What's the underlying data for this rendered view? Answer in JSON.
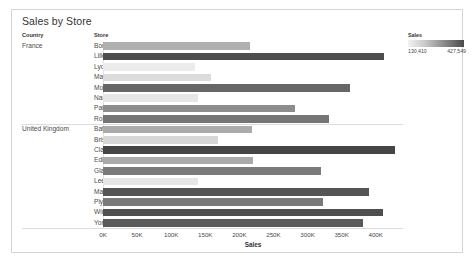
{
  "title": "Sales by Store",
  "columns": {
    "country": "Country",
    "store": "Store"
  },
  "legend": {
    "title": "Sales",
    "min_label": "130,410",
    "max_label": "427,549",
    "min_value": 130410,
    "max_value": 427549,
    "ramp_low_color": "#f2f2f2",
    "ramp_high_color": "#4a4a4a"
  },
  "axis": {
    "title": "Sales",
    "ticks": [
      "0K",
      "50K",
      "100K",
      "150K",
      "200K",
      "250K",
      "300K",
      "350K",
      "400K"
    ],
    "tick_values": [
      0,
      50000,
      100000,
      150000,
      200000,
      250000,
      300000,
      350000,
      400000
    ]
  },
  "chart_data": {
    "type": "bar",
    "title": "Sales by Store",
    "xlabel": "Sales",
    "ylabel": "Store",
    "orientation": "horizontal",
    "xlim": [
      0,
      440000
    ],
    "grid": false,
    "legend_position": "top-right",
    "color_encoding": "Sales",
    "groups": [
      {
        "country": "France",
        "rows": [
          {
            "store": "Bordeaux",
            "value": 215000,
            "color": "#b0b0b0"
          },
          {
            "store": "Lille",
            "value": 412000,
            "color": "#4e4e4e"
          },
          {
            "store": "Lyon",
            "value": 135000,
            "color": "#ececec"
          },
          {
            "store": "Marseille",
            "value": 158000,
            "color": "#dcdcdc"
          },
          {
            "store": "Montpellier",
            "value": 362000,
            "color": "#666666"
          },
          {
            "store": "Nantes",
            "value": 140000,
            "color": "#e6e6e6"
          },
          {
            "store": "Paris",
            "value": 282000,
            "color": "#8d8d8d"
          },
          {
            "store": "Rouen",
            "value": 332000,
            "color": "#757575"
          }
        ]
      },
      {
        "country": "United Kingdom",
        "rows": [
          {
            "store": "Bath",
            "value": 218000,
            "color": "#ababab"
          },
          {
            "store": "Bristol",
            "value": 168000,
            "color": "#d7d7d7"
          },
          {
            "store": "Clapham",
            "value": 427549,
            "color": "#454545"
          },
          {
            "store": "Edinburgh",
            "value": 220000,
            "color": "#aaaaaa"
          },
          {
            "store": "Glasgow",
            "value": 320000,
            "color": "#7b7b7b"
          },
          {
            "store": "Leeds",
            "value": 140000,
            "color": "#e6e6e6"
          },
          {
            "store": "Manchester",
            "value": 390000,
            "color": "#555555"
          },
          {
            "store": "Plymouth",
            "value": 322000,
            "color": "#7a7a7a"
          },
          {
            "store": "Wimbledon",
            "value": 410000,
            "color": "#4f4f4f"
          },
          {
            "store": "York",
            "value": 382000,
            "color": "#5a5a5a"
          }
        ]
      }
    ]
  }
}
